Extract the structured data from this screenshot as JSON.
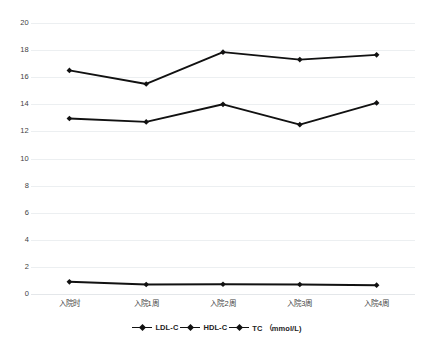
{
  "chart_data": {
    "type": "line",
    "title": "",
    "xlabel": "",
    "ylabel": "",
    "ylim": [
      0,
      20
    ],
    "ytick_step": 2,
    "yticks": [
      20,
      18,
      16,
      14,
      12,
      10,
      8,
      6,
      4,
      2,
      0
    ],
    "grid": true,
    "legend_position": "bottom-center",
    "categories": [
      "入院时",
      "入院1周",
      "入院2周",
      "入院3周",
      "入院4周"
    ],
    "series": [
      {
        "name": "LDL-C",
        "values": [
          12.95,
          12.7,
          14.0,
          12.5,
          14.1
        ],
        "color": "#111111"
      },
      {
        "name": "HDL-C",
        "values": [
          0.9,
          0.7,
          0.72,
          0.7,
          0.65
        ],
        "color": "#111111"
      },
      {
        "name": "TC （mmol/L)",
        "values": [
          16.5,
          15.5,
          17.85,
          17.3,
          17.65
        ],
        "color": "#111111"
      }
    ]
  },
  "legend": {
    "items": [
      {
        "label": "LDL-C"
      },
      {
        "label": "HDL-C"
      },
      {
        "label": "TC （mmol/L)"
      }
    ]
  },
  "colors": {
    "background": "#ffffff",
    "line": "#111111",
    "grid": "#eceff1",
    "text": "#3f3f3f"
  }
}
